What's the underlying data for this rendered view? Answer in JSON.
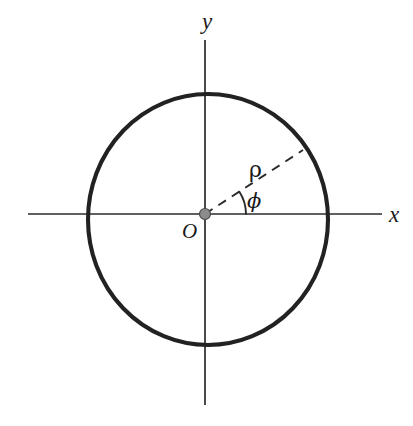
{
  "figure": {
    "name": "polar-coordinate-circle-diagram",
    "background_color": "#ffffff",
    "width": 413,
    "height": 426
  },
  "labels": {
    "y_axis": "y",
    "x_axis": "x",
    "origin": "O",
    "radius": "ρ",
    "angle": "ϕ"
  },
  "colors": {
    "axis": "#2b2b2b",
    "circle": "#222222",
    "origin_dot_fill": "#8b8b8b",
    "origin_dot_stroke": "#4a4a4a",
    "dashed_radius": "#2b2b2b",
    "text": "#1a1a1a"
  },
  "chart_data": {
    "type": "scatter",
    "title": "",
    "subtitle": "",
    "xlabel": "x",
    "ylabel": "y",
    "grid": false,
    "legend": null,
    "axes": {
      "origin_px": [
        205,
        214
      ],
      "x_axis_extent_px": [
        28,
        382
      ],
      "y_axis_extent_px": [
        40,
        405
      ],
      "x_axis_y_px": 214,
      "y_axis_x_px": 205,
      "arrowheads": false,
      "tick_labels": []
    },
    "shapes": [
      {
        "name": "circle",
        "kind": "ellipse",
        "center_px": [
          208,
          219.5
        ],
        "rx_px": 120,
        "ry_px": 125.5,
        "stroke_width_px": 4.1,
        "fill": "none"
      },
      {
        "name": "origin-marker",
        "kind": "point",
        "center_px": [
          205,
          214
        ],
        "radius_px": 5.5
      },
      {
        "name": "radius-vector",
        "kind": "dashed-segment",
        "from_px": [
          205,
          214
        ],
        "to_px": [
          303,
          150
        ],
        "dash_pattern": "9 7",
        "label": "ρ"
      },
      {
        "name": "angle-arc",
        "kind": "arc",
        "center_px": [
          205,
          214
        ],
        "radius_px": 41,
        "start_angle_deg": 0,
        "end_angle_deg": 33,
        "label": "ϕ"
      }
    ],
    "annotations": [
      {
        "text": "y",
        "at_px": [
          208,
          22
        ],
        "style": "italic-serif"
      },
      {
        "text": "x",
        "at_px": [
          394,
          214
        ],
        "style": "italic-serif"
      },
      {
        "text": "O",
        "at_px": [
          190,
          233
        ],
        "style": "italic-serif"
      },
      {
        "text": "ρ",
        "at_px": [
          256,
          172
        ],
        "style": "upright-greek"
      },
      {
        "text": "ϕ",
        "at_px": [
          255,
          203
        ],
        "style": "italic-greek"
      }
    ]
  }
}
